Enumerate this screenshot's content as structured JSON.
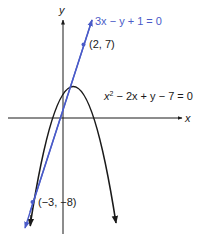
{
  "diagram": {
    "axes": {
      "x_label": "x",
      "y_label": "y"
    },
    "curves": [
      {
        "id": "parabola",
        "equation_label_prefix": "x",
        "equation_label_sup": "2",
        "equation_label_rest": " − 2x + y − 7 = 0",
        "equation_full": "x² − 2x + y − 7 = 0",
        "color": "#1a1a1a"
      },
      {
        "id": "line",
        "equation_label": "3x − y + 1 = 0",
        "color": "#4a5bc8"
      }
    ],
    "points": [
      {
        "label": "(2, 7)",
        "x": 2,
        "y": 7
      },
      {
        "label": "(−3, −8)",
        "x": -3,
        "y": -8
      }
    ],
    "colors": {
      "axis": "#1a1a1a",
      "parabola": "#1a1a1a",
      "line": "#4a5bc8",
      "point": "#4a5bc8",
      "background": "#ffffff"
    }
  }
}
